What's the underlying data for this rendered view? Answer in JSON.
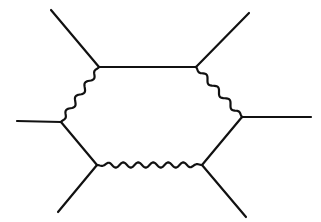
{
  "diagram": {
    "type": "feynman-diagram",
    "stroke_color": "#111111",
    "background": "#ffffff",
    "vertices": {
      "top_left": [
        99,
        67
      ],
      "top_right": [
        196,
        67
      ],
      "right": [
        242,
        117
      ],
      "bottom_right": [
        202,
        165
      ],
      "bottom_left": [
        97,
        165
      ],
      "left": [
        61,
        122
      ]
    },
    "external_legs": [
      {
        "name": "leg-top-left",
        "from": [
          51,
          10
        ],
        "to": [
          99,
          67
        ]
      },
      {
        "name": "leg-top-right",
        "from": [
          249,
          13
        ],
        "to": [
          196,
          67
        ]
      },
      {
        "name": "leg-right",
        "from": [
          311,
          117
        ],
        "to": [
          242,
          117
        ]
      },
      {
        "name": "leg-bottom-right",
        "from": [
          246,
          217
        ],
        "to": [
          202,
          165
        ]
      },
      {
        "name": "leg-bottom-left",
        "from": [
          58,
          212
        ],
        "to": [
          97,
          165
        ]
      },
      {
        "name": "leg-left",
        "from": [
          17,
          121
        ],
        "to": [
          61,
          122
        ]
      }
    ],
    "internal_edges": [
      {
        "name": "edge-top",
        "from": "top_left",
        "to": "top_right",
        "style": "straight"
      },
      {
        "name": "edge-top-right",
        "from": "top_right",
        "to": "right",
        "style": "wavy"
      },
      {
        "name": "edge-lower-right",
        "from": "right",
        "to": "bottom_right",
        "style": "straight"
      },
      {
        "name": "edge-bottom",
        "from": "bottom_right",
        "to": "bottom_left",
        "style": "wavy"
      },
      {
        "name": "edge-lower-left",
        "from": "bottom_left",
        "to": "left",
        "style": "straight"
      },
      {
        "name": "edge-top-left",
        "from": "left",
        "to": "top_left",
        "style": "wavy"
      }
    ]
  }
}
